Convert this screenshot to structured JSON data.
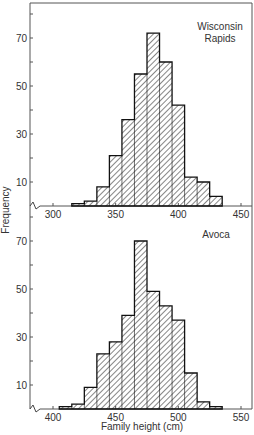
{
  "chart_data": [
    {
      "type": "bar",
      "title": "Wisconsin Rapids",
      "xlabel": "",
      "ylabel": "Frequency",
      "x_ticks": [
        300,
        350,
        400,
        450
      ],
      "y_ticks": [
        10,
        30,
        50,
        70
      ],
      "xlim": [
        283,
        475
      ],
      "ylim": [
        0,
        84
      ],
      "bin_width": 10,
      "bin_edges": [
        315,
        325,
        335,
        345,
        355,
        365,
        375,
        385,
        395,
        405,
        415,
        425,
        435
      ],
      "values": [
        1,
        2,
        8,
        21,
        36,
        55,
        72,
        60,
        42,
        12,
        10,
        4
      ],
      "fill": "diagonal-hatch",
      "grid": false
    },
    {
      "type": "bar",
      "title": "Avoca",
      "xlabel": "Family height (cm)",
      "ylabel": "Frequency",
      "x_ticks": [
        400,
        450,
        500,
        550
      ],
      "y_ticks": [
        10,
        30,
        50,
        70
      ],
      "xlim": [
        383,
        575
      ],
      "ylim": [
        0,
        84
      ],
      "bin_width": 10,
      "bin_edges": [
        405,
        415,
        425,
        435,
        445,
        455,
        465,
        475,
        485,
        495,
        505,
        515,
        525,
        535
      ],
      "values": [
        1,
        2,
        9,
        23,
        28,
        39,
        70,
        49,
        43,
        37,
        15,
        3,
        1
      ],
      "fill": "diagonal-hatch",
      "grid": false
    }
  ],
  "labels": {
    "top_title_line1": "Wisconsin",
    "top_title_line2": "Rapids",
    "bottom_title": "Avoca",
    "ylabel": "Frequency",
    "xlabel": "Family height (cm)"
  }
}
